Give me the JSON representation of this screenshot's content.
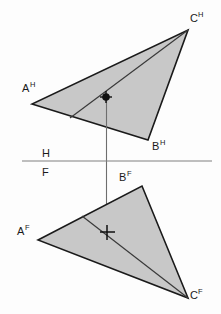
{
  "figure": {
    "type": "descriptive-geometry-orthographic-projection",
    "background_color": "#fdfdfd",
    "fill_color": "#c8c8c8",
    "stroke_color": "#1a1a1a",
    "fold_line_color": "#808080",
    "projector_color": "#6e6e6e"
  },
  "fold_line": {
    "upper_label": "H",
    "lower_label": "F",
    "x1": 22,
    "y1": 161,
    "x2": 212,
    "y2": 161,
    "upper_label_x": 45,
    "upper_label_y": 157,
    "lower_label_x": 45,
    "lower_label_y": 175
  },
  "views": [
    {
      "name": "top-view",
      "plane": "H",
      "vertices": [
        {
          "id": "A",
          "label": "A",
          "superscript": "H",
          "x": 32,
          "y": 104,
          "label_x": 22,
          "label_y": 92
        },
        {
          "id": "B",
          "label": "B",
          "superscript": "H",
          "x": 148,
          "y": 140,
          "label_x": 152,
          "label_y": 150
        },
        {
          "id": "C",
          "label": "C",
          "superscript": "H",
          "x": 188,
          "y": 30,
          "label_x": 190,
          "label_y": 22
        }
      ],
      "interior_line": {
        "from_x": 70,
        "from_y": 118,
        "to_x": 188,
        "to_y": 30
      },
      "point_marker": {
        "style": "dot-and-cross",
        "x": 106,
        "y": 97,
        "radius": 4,
        "cross_arm": 6
      }
    },
    {
      "name": "front-view",
      "plane": "F",
      "vertices": [
        {
          "id": "A",
          "label": "A",
          "superscript": "F",
          "x": 38,
          "y": 240,
          "label_x": 18,
          "label_y": 234
        },
        {
          "id": "B",
          "label": "B",
          "superscript": "F",
          "x": 142,
          "y": 186,
          "label_x": 120,
          "label_y": 180
        },
        {
          "id": "C",
          "label": "C",
          "superscript": "F",
          "x": 188,
          "y": 298,
          "label_x": 192,
          "label_y": 297
        }
      ],
      "interior_line": {
        "from_x": 82,
        "from_y": 216,
        "to_x": 188,
        "to_y": 298
      },
      "point_marker": {
        "style": "cross",
        "x": 107,
        "y": 232,
        "cross_arm": 7
      }
    }
  ],
  "projector": {
    "label": "vertical-projection-line",
    "x": 106.5,
    "y_top": 97,
    "y_bottom": 232
  }
}
